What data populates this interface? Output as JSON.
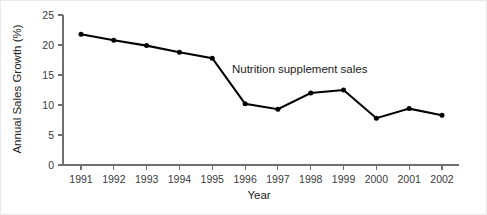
{
  "chart_data": {
    "type": "line",
    "title": "",
    "xlabel": "Year",
    "ylabel": "Annual Sales Growth (%)",
    "categories": [
      "1991",
      "1992",
      "1993",
      "1994",
      "1995",
      "1996",
      "1997",
      "1998",
      "1999",
      "2000",
      "2001",
      "2002"
    ],
    "x": [
      1991,
      1992,
      1993,
      1994,
      1995,
      1996,
      1997,
      1998,
      1999,
      2000,
      2001,
      2002
    ],
    "series": [
      {
        "name": "Nutrition supplement sales",
        "values": [
          21.8,
          20.8,
          19.9,
          18.8,
          17.8,
          10.2,
          9.3,
          12.0,
          12.5,
          7.8,
          9.4,
          8.3
        ]
      }
    ],
    "annotations": [
      {
        "text": "Nutrition supplement sales",
        "x": 1995.6,
        "y": 15.4
      }
    ],
    "ylim": [
      0,
      25
    ],
    "yticks": [
      0,
      5,
      10,
      15,
      20,
      25
    ],
    "ytick_labels": [
      "0",
      "5",
      "10",
      "15",
      "20",
      "25"
    ],
    "xticks": [
      1991,
      1992,
      1993,
      1994,
      1995,
      1996,
      1997,
      1998,
      1999,
      2000,
      2001,
      2002
    ],
    "grid": false,
    "legend": false,
    "legend_position": "none",
    "marker": "circle",
    "line_color": "#000000",
    "axis_color": "#6f6f6f"
  }
}
